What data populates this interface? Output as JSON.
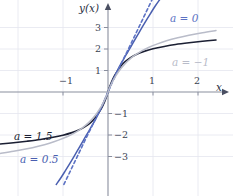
{
  "figure": {
    "background": "#ffffff",
    "axis_color": "#8a8f9e",
    "grid_color": "#e4e6ef",
    "tick_text_color": "#3a3f52",
    "y_axis_label": "y(x)",
    "x_axis_label": "x"
  },
  "axes": {
    "origin_px": {
      "x": 108,
      "y": 92
    },
    "x_scale_px_per_unit": 45,
    "y_scale_px_per_unit": 21.5,
    "x_ticks": [
      {
        "value": -1,
        "label": "−1"
      },
      {
        "value": 1,
        "label": "1"
      },
      {
        "value": 2,
        "label": "2"
      }
    ],
    "y_ticks": [
      {
        "value": 3,
        "label": "3"
      },
      {
        "value": 2,
        "label": "2"
      },
      {
        "value": 1,
        "label": "1"
      },
      {
        "value": -1,
        "label": "−1"
      },
      {
        "value": -2,
        "label": "−2"
      },
      {
        "value": -3,
        "label": "−3"
      }
    ],
    "grid": true,
    "xlim": [
      -2.4,
      2.75
    ],
    "ylim": [
      -4.3,
      4.8
    ]
  },
  "chart_data": {
    "type": "line",
    "title": "",
    "xlabel": "x",
    "ylabel": "y(x)",
    "xlim": [
      -2.4,
      2.75
    ],
    "ylim": [
      -4.3,
      4.8
    ],
    "grid": true,
    "legend": "inline-annotations",
    "series": [
      {
        "name": "a = 1.5",
        "label": "a = 1.5",
        "color": "#1b1f33",
        "style": "solid",
        "width": 1.6,
        "label_px": {
          "x": 14,
          "y": 131
        },
        "points": [
          [
            -2.4,
            -2.42
          ],
          [
            -2.1,
            -2.36
          ],
          [
            -1.8,
            -2.29
          ],
          [
            -1.5,
            -2.21
          ],
          [
            -1.25,
            -2.12
          ],
          [
            -1.0,
            -2.01
          ],
          [
            -0.8,
            -1.89
          ],
          [
            -0.65,
            -1.77
          ],
          [
            -0.5,
            -1.6
          ],
          [
            -0.38,
            -1.41
          ],
          [
            -0.28,
            -1.19
          ],
          [
            -0.2,
            -0.95
          ],
          [
            -0.14,
            -0.74
          ],
          [
            -0.09,
            -0.52
          ],
          [
            -0.05,
            -0.31
          ],
          [
            -0.02,
            -0.13
          ],
          [
            0.0,
            0.0
          ],
          [
            0.02,
            0.13
          ],
          [
            0.05,
            0.31
          ],
          [
            0.09,
            0.52
          ],
          [
            0.14,
            0.74
          ],
          [
            0.2,
            0.95
          ],
          [
            0.28,
            1.19
          ],
          [
            0.38,
            1.41
          ],
          [
            0.5,
            1.6
          ],
          [
            0.65,
            1.77
          ],
          [
            0.8,
            1.89
          ],
          [
            1.0,
            2.01
          ],
          [
            1.25,
            2.12
          ],
          [
            1.5,
            2.21
          ],
          [
            1.8,
            2.29
          ],
          [
            2.1,
            2.36
          ],
          [
            2.4,
            2.42
          ]
        ]
      },
      {
        "name": "a = 0.5",
        "label": "a = 0.5",
        "color": "#4a5fb0",
        "style": "solid",
        "width": 1.5,
        "label_px": {
          "x": 20,
          "y": 154
        },
        "points": [
          [
            -1.15,
            -4.3
          ],
          [
            -1.05,
            -4.0
          ],
          [
            -0.95,
            -3.67
          ],
          [
            -0.85,
            -3.33
          ],
          [
            -0.75,
            -2.98
          ],
          [
            -0.65,
            -2.62
          ],
          [
            -0.55,
            -2.26
          ],
          [
            -0.45,
            -1.9
          ],
          [
            -0.36,
            -1.58
          ],
          [
            -0.28,
            -1.28
          ],
          [
            -0.21,
            -1.0
          ],
          [
            -0.15,
            -0.74
          ],
          [
            -0.1,
            -0.51
          ],
          [
            -0.06,
            -0.31
          ],
          [
            -0.03,
            -0.16
          ],
          [
            0.0,
            0.0
          ],
          [
            0.03,
            0.16
          ],
          [
            0.06,
            0.31
          ],
          [
            0.1,
            0.51
          ],
          [
            0.15,
            0.74
          ],
          [
            0.21,
            1.0
          ],
          [
            0.28,
            1.28
          ],
          [
            0.36,
            1.58
          ],
          [
            0.45,
            1.9
          ],
          [
            0.55,
            2.26
          ],
          [
            0.65,
            2.62
          ],
          [
            0.75,
            2.98
          ],
          [
            0.85,
            3.33
          ],
          [
            0.95,
            3.67
          ],
          [
            1.05,
            4.0
          ],
          [
            1.15,
            4.3
          ]
        ]
      },
      {
        "name": "a = 0",
        "label": "a = 0",
        "color": "#5c72c4",
        "style": "dashed",
        "width": 1.6,
        "dash": "3.2 2.6",
        "label_px": {
          "x": 170,
          "y": 13
        },
        "points": [
          [
            -0.98,
            -4.3
          ],
          [
            -0.9,
            -3.95
          ],
          [
            -0.82,
            -3.6
          ],
          [
            -0.74,
            -3.25
          ],
          [
            -0.66,
            -2.9
          ],
          [
            -0.58,
            -2.55
          ],
          [
            -0.5,
            -2.2
          ],
          [
            -0.42,
            -1.86
          ],
          [
            -0.34,
            -1.52
          ],
          [
            -0.27,
            -1.22
          ],
          [
            -0.2,
            -0.92
          ],
          [
            -0.14,
            -0.65
          ],
          [
            -0.09,
            -0.43
          ],
          [
            -0.05,
            -0.24
          ],
          [
            -0.02,
            -0.1
          ],
          [
            0.0,
            0.0
          ],
          [
            0.02,
            0.1
          ],
          [
            0.05,
            0.24
          ],
          [
            0.09,
            0.43
          ],
          [
            0.14,
            0.65
          ],
          [
            0.2,
            0.92
          ],
          [
            0.27,
            1.22
          ],
          [
            0.34,
            1.52
          ],
          [
            0.42,
            1.86
          ],
          [
            0.5,
            2.2
          ],
          [
            0.58,
            2.55
          ],
          [
            0.66,
            2.9
          ],
          [
            0.74,
            3.25
          ],
          [
            0.82,
            3.6
          ],
          [
            0.9,
            3.95
          ],
          [
            0.98,
            4.3
          ]
        ]
      },
      {
        "name": "a = -1",
        "label": "a = −1",
        "color": "#b9bcc9",
        "style": "solid",
        "width": 1.5,
        "label_px": {
          "x": 172,
          "y": 57
        },
        "points": [
          [
            -2.4,
            -2.86
          ],
          [
            -2.1,
            -2.76
          ],
          [
            -1.8,
            -2.64
          ],
          [
            -1.55,
            -2.52
          ],
          [
            -1.3,
            -2.38
          ],
          [
            -1.1,
            -2.24
          ],
          [
            -0.9,
            -2.07
          ],
          [
            -0.75,
            -1.91
          ],
          [
            -0.6,
            -1.71
          ],
          [
            -0.48,
            -1.52
          ],
          [
            -0.38,
            -1.32
          ],
          [
            -0.3,
            -1.13
          ],
          [
            -0.23,
            -0.93
          ],
          [
            -0.17,
            -0.74
          ],
          [
            -0.12,
            -0.56
          ],
          [
            -0.08,
            -0.39
          ],
          [
            -0.04,
            -0.21
          ],
          [
            -0.01,
            -0.06
          ],
          [
            0.0,
            0.0
          ],
          [
            0.01,
            0.06
          ],
          [
            0.04,
            0.21
          ],
          [
            0.08,
            0.39
          ],
          [
            0.12,
            0.56
          ],
          [
            0.17,
            0.74
          ],
          [
            0.23,
            0.93
          ],
          [
            0.3,
            1.13
          ],
          [
            0.38,
            1.32
          ],
          [
            0.48,
            1.52
          ],
          [
            0.6,
            1.71
          ],
          [
            0.75,
            1.91
          ],
          [
            0.9,
            2.07
          ],
          [
            1.1,
            2.24
          ],
          [
            1.3,
            2.38
          ],
          [
            1.55,
            2.52
          ],
          [
            1.8,
            2.64
          ],
          [
            2.1,
            2.76
          ],
          [
            2.4,
            2.86
          ]
        ]
      }
    ],
    "annotations": [
      {
        "text": "a = 0",
        "color": "#5c72c4"
      },
      {
        "text": "a = −1",
        "color": "#b9bcc9"
      },
      {
        "text": "a = 1.5",
        "color": "#1b1f33"
      },
      {
        "text": "a = 0.5",
        "color": "#4a5fb0"
      }
    ]
  }
}
